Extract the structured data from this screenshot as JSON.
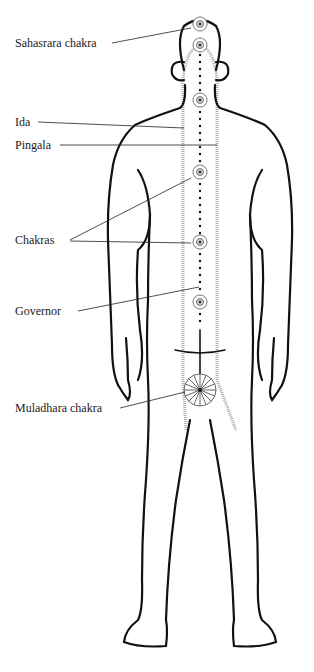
{
  "diagram": {
    "type": "anatomical-energy-diagram",
    "labels": [
      {
        "id": "sahasrara",
        "text": "Sahasrara chakra",
        "x": 15,
        "y": 36
      },
      {
        "id": "ida",
        "text": "Ida",
        "x": 15,
        "y": 115
      },
      {
        "id": "pingala",
        "text": "Pingala",
        "x": 15,
        "y": 138
      },
      {
        "id": "chakras",
        "text": "Chakras",
        "x": 15,
        "y": 233
      },
      {
        "id": "governor",
        "text": "Governor",
        "x": 15,
        "y": 304
      },
      {
        "id": "muladhara",
        "text": "Muladhara chakra",
        "x": 15,
        "y": 401
      }
    ],
    "chakras": [
      {
        "name": "Sahasrara",
        "cx": 200,
        "cy": 24,
        "r": 7
      },
      {
        "name": "crown-2",
        "cx": 200,
        "cy": 45,
        "r": 7
      },
      {
        "name": "throat",
        "cx": 200,
        "cy": 100,
        "r": 7
      },
      {
        "name": "heart",
        "cx": 200,
        "cy": 172,
        "r": 7
      },
      {
        "name": "solar",
        "cx": 200,
        "cy": 242,
        "r": 7
      },
      {
        "name": "sacral",
        "cx": 200,
        "cy": 302,
        "r": 7
      },
      {
        "name": "Muladhara",
        "cx": 200,
        "cy": 390,
        "r": 16
      }
    ],
    "colors": {
      "ink": "#111111",
      "channel": "#aaaaaa",
      "label": "#222222"
    }
  }
}
